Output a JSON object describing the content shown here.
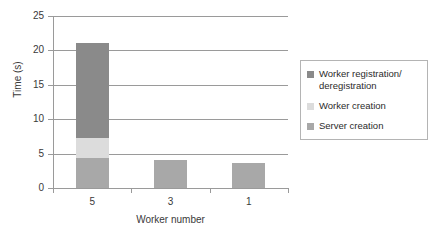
{
  "chart_data": {
    "type": "bar",
    "subtype": "stacked-bar",
    "title": "",
    "xlabel": "Worker number",
    "ylabel": "Time (s)",
    "categories": [
      "5",
      "3",
      "1"
    ],
    "ylim": [
      0,
      25
    ],
    "yticks": [
      0,
      5,
      10,
      15,
      20,
      25
    ],
    "ytick_labels": [
      "0",
      "5",
      "10",
      "15",
      "20",
      "25"
    ],
    "grid": "horizontal",
    "legend_position": "right",
    "series": [
      {
        "name": "Worker registration/deregistration",
        "color": "#8a8a8a",
        "values": [
          13.8,
          0,
          0
        ]
      },
      {
        "name": "Worker creation",
        "color": "#dcdcdc",
        "values": [
          2.9,
          0,
          0
        ]
      },
      {
        "name": "Server creation",
        "color": "#a8a8a8",
        "values": [
          4.4,
          4.1,
          3.6
        ]
      }
    ],
    "stack_totals": [
      21.1,
      4.1,
      3.6
    ]
  },
  "axes": {
    "y_title": "Time (s)",
    "x_title": "Worker number"
  },
  "legend": {
    "entries": [
      {
        "label": "Worker registration/ deregistration",
        "color": "#8a8a8a"
      },
      {
        "label": "Worker creation",
        "color": "#dcdcdc"
      },
      {
        "label": "Server creation",
        "color": "#a8a8a8"
      }
    ]
  },
  "colors": {
    "axis": "#9a9a9a",
    "text": "#2b2b2b",
    "legend_border": "#b4b4b4",
    "background": "#ffffff"
  }
}
